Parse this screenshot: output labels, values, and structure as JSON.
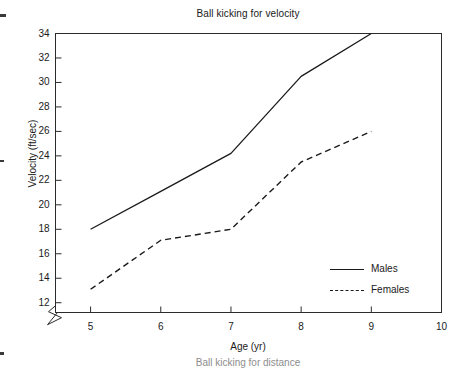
{
  "figure": {
    "title": "Ball kicking for velocity",
    "next_figure_title": "Ball kicking for distance"
  },
  "axes": {
    "x_label": "Age (yr)",
    "y_label": "Velocity (ft/sec)",
    "x_ticks": [
      "5",
      "6",
      "7",
      "8",
      "9",
      "10"
    ],
    "y_ticks": [
      "12",
      "14",
      "16",
      "18",
      "20",
      "22",
      "24",
      "26",
      "28",
      "30",
      "32",
      "34"
    ]
  },
  "legend": {
    "items": [
      {
        "label": "Males",
        "style": "solid"
      },
      {
        "label": "Females",
        "style": "dashed"
      }
    ]
  },
  "colors": {
    "line": "#1a1a1a",
    "axis": "#2b2b2b",
    "background": "#ffffff"
  },
  "chart_data": {
    "type": "line",
    "title": "Ball kicking for velocity",
    "xlabel": "Age (yr)",
    "ylabel": "Velocity (ft/sec)",
    "x": [
      5,
      6,
      7,
      8,
      9
    ],
    "xlim": [
      4.5,
      10
    ],
    "ylim": [
      11.2,
      34
    ],
    "y_axis_break": true,
    "grid": false,
    "legend_position": "bottom-right-inside",
    "xticks": [
      5,
      6,
      7,
      8,
      9,
      10
    ],
    "yticks": [
      12,
      14,
      16,
      18,
      20,
      22,
      24,
      26,
      28,
      30,
      32,
      34
    ],
    "series": [
      {
        "name": "Males",
        "style": "solid",
        "values": [
          18.0,
          21.1,
          24.2,
          30.5,
          34.0
        ]
      },
      {
        "name": "Females",
        "style": "dashed",
        "values": [
          13.1,
          17.1,
          18.0,
          23.5,
          26.0
        ]
      }
    ]
  }
}
